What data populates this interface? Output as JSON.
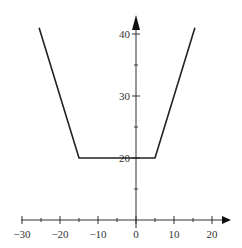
{
  "chart_data": {
    "type": "line",
    "title": "",
    "xlabel": "",
    "ylabel": "",
    "xlim": [
      -30,
      20
    ],
    "ylim": [
      10,
      42
    ],
    "x_origin_y": 10,
    "grid": false,
    "legend": null,
    "x_major_ticks": [
      -30,
      -20,
      -10,
      0,
      10,
      20
    ],
    "x_minor_ticks": [
      -25,
      -15,
      -5,
      5,
      15
    ],
    "x_tick_labels": [
      "−30",
      "−20",
      "−10",
      "0",
      "10",
      "20"
    ],
    "y_major_ticks": [
      20,
      30,
      40
    ],
    "y_minor_ticks": [
      15,
      25,
      35
    ],
    "y_tick_labels": [
      "20",
      "30",
      "40"
    ],
    "series": [
      {
        "name": "y = |x + 15| + |x − 5|",
        "x": [
          -25.5,
          -15,
          5,
          15.5
        ],
        "y": [
          41,
          20,
          20,
          41
        ]
      }
    ],
    "colors": {
      "axis": "#333333",
      "curve": "#222222"
    }
  }
}
